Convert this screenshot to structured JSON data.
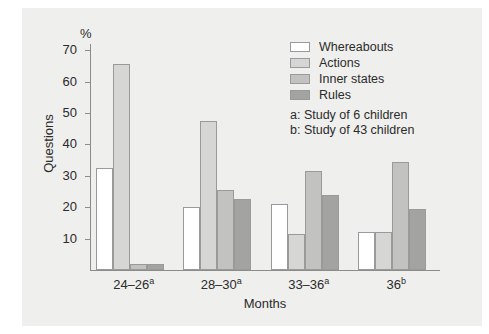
{
  "figure": {
    "unit_label": "%",
    "x_title": "Months",
    "y_title": "Questions"
  },
  "legend": {
    "items": [
      {
        "label": "Whereabouts",
        "color": "#ffffff"
      },
      {
        "label": "Actions",
        "color": "#d6d6d4"
      },
      {
        "label": "Inner states",
        "color": "#c2c2c0"
      },
      {
        "label": "Rules",
        "color": "#a3a3a1"
      }
    ],
    "notes": [
      "a: Study of 6 children",
      "b: Study of 43 children"
    ]
  },
  "margin_marks": [
    "",
    "",
    "",
    ""
  ],
  "chart_data": {
    "type": "bar",
    "title": "",
    "xlabel": "Months",
    "ylabel": "Questions",
    "unit": "%",
    "ylim": [
      0,
      72
    ],
    "yticks": [
      10,
      20,
      30,
      40,
      50,
      60,
      70
    ],
    "grid": false,
    "legend_position": "top-right",
    "categories": [
      "24–26",
      "28–30",
      "33–36",
      "36"
    ],
    "category_superscripts": [
      "a",
      "a",
      "a",
      "b"
    ],
    "category_labels": [
      "24–26a",
      "28–30a",
      "33–36a",
      "36b"
    ],
    "series": [
      {
        "name": "Whereabouts",
        "color": "#ffffff",
        "values": [
          32.5,
          20.0,
          21.0,
          12.0
        ]
      },
      {
        "name": "Actions",
        "color": "#d6d6d4",
        "values": [
          65.5,
          47.5,
          11.5,
          12.0
        ]
      },
      {
        "name": "Inner states",
        "color": "#c2c2c0",
        "values": [
          2.0,
          25.5,
          31.5,
          34.5
        ]
      },
      {
        "name": "Rules",
        "color": "#a3a3a1",
        "values": [
          2.0,
          22.5,
          24.0,
          19.5
        ]
      }
    ],
    "annotations": [
      "a: Study of 6 children",
      "b: Study of 43 children"
    ]
  }
}
